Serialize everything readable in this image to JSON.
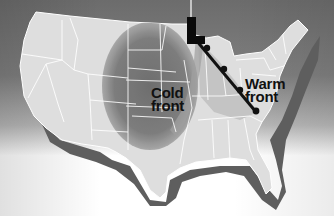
{
  "map": {
    "region": "Contiguous United States",
    "low_pressure_symbol": "L",
    "cold_front_label": [
      "Cold",
      "front"
    ],
    "warm_front_label": [
      "Warm",
      "front"
    ]
  },
  "colors": {
    "land": "#dcdcdc",
    "cold_air_mass": "#8a8a8a",
    "warm_sector": "#c8c8c8",
    "shadow": "#5e5e5e",
    "front_line": "#111111",
    "state_borders": "#ffffff"
  }
}
